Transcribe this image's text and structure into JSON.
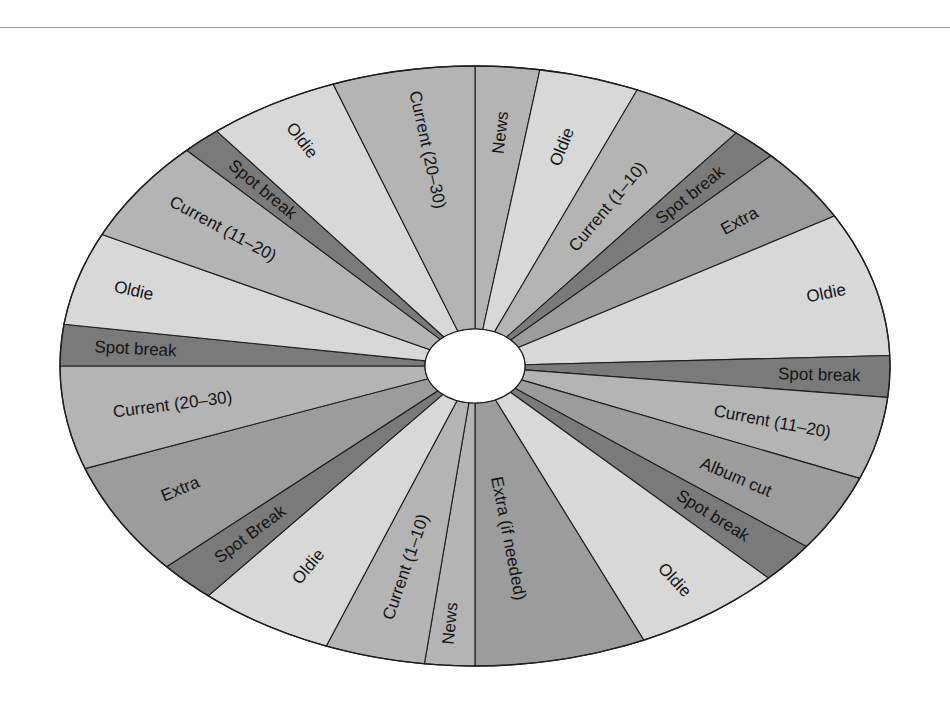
{
  "diagram": {
    "type": "radio-format-clock-wheel",
    "center": {
      "x": 475,
      "y": 366,
      "rx": 50,
      "ry": 37
    },
    "outer": {
      "rx": 415,
      "ry": 300
    },
    "colors": {
      "light": "#d8d8d8",
      "medium": "#b4b4b4",
      "medium_dark": "#9c9c9c",
      "dark": "#7a7a7a",
      "outline": "#1e1e1e"
    },
    "segments": [
      {
        "label": "News",
        "start": 270.0,
        "end": 279.0,
        "shade": "medium",
        "text_angle": 274.5,
        "text_r": 0.78
      },
      {
        "label": "Oldie",
        "start": 279.0,
        "end": 293.0,
        "shade": "light",
        "text_angle": 286.0,
        "text_r": 0.76
      },
      {
        "label": "Current (1–10)",
        "start": 293.0,
        "end": 309.0,
        "shade": "medium",
        "text_angle": 301.0,
        "text_r": 0.62
      },
      {
        "label": "Spot break",
        "start": 309.0,
        "end": 315.5,
        "shade": "dark",
        "text_angle": 312.3,
        "text_r": 0.77
      },
      {
        "label": "Extra",
        "start": 315.5,
        "end": 330.0,
        "shade": "medium_dark",
        "text_angle": 322.8,
        "text_r": 0.8
      },
      {
        "label": "Oldie",
        "start": 330.0,
        "end": 358.0,
        "shade": "light",
        "text_angle": 344.0,
        "text_r": 0.88
      },
      {
        "label": "Spot break",
        "start": 358.0,
        "end": 6.0,
        "shade": "dark",
        "text_angle": 2.0,
        "text_r": 0.83
      },
      {
        "label": "Current (11–20)",
        "start": 6.0,
        "end": 22.0,
        "shade": "medium",
        "text_angle": 14.5,
        "text_r": 0.74
      },
      {
        "label": "Album cut",
        "start": 22.0,
        "end": 37.0,
        "shade": "medium_dark",
        "text_angle": 30.5,
        "text_r": 0.73
      },
      {
        "label": "Spot break",
        "start": 37.0,
        "end": 45.0,
        "shade": "dark",
        "text_angle": 41.0,
        "text_r": 0.76
      },
      {
        "label": "Oldie",
        "start": 45.0,
        "end": 66.0,
        "shade": "light",
        "text_angle": 56.0,
        "text_r": 0.86
      },
      {
        "label": "Extra (if needed)",
        "start": 66.0,
        "end": 90.0,
        "shade": "medium_dark",
        "text_angle": 82.0,
        "text_r": 0.58
      },
      {
        "label": "News",
        "start": 90.0,
        "end": 97.0,
        "shade": "medium",
        "text_angle": 94.0,
        "text_r": 0.86
      },
      {
        "label": "Current (1–10)",
        "start": 97.0,
        "end": 111.0,
        "shade": "medium",
        "text_angle": 104.0,
        "text_r": 0.69
      },
      {
        "label": "Oldie",
        "start": 111.0,
        "end": 130.0,
        "shade": "light",
        "text_angle": 121.0,
        "text_r": 0.78
      },
      {
        "label": "Spot Break",
        "start": 130.0,
        "end": 138.0,
        "shade": "dark",
        "text_angle": 134.0,
        "text_r": 0.78
      },
      {
        "label": "Extra",
        "start": 138.0,
        "end": 160.0,
        "shade": "medium_dark",
        "text_angle": 150.0,
        "text_r": 0.82
      },
      {
        "label": "Current (20–30)",
        "start": 160.0,
        "end": 180.0,
        "shade": "medium",
        "text_angle": 170.0,
        "text_r": 0.74
      },
      {
        "label": "Spot break",
        "start": 180.0,
        "end": 188.0,
        "shade": "dark",
        "text_angle": 184.0,
        "text_r": 0.82
      },
      {
        "label": "Oldie",
        "start": 188.0,
        "end": 206.0,
        "shade": "light",
        "text_angle": 197.0,
        "text_r": 0.86
      },
      {
        "label": "Current (11–20)",
        "start": 206.0,
        "end": 226.0,
        "shade": "medium",
        "text_angle": 217.0,
        "text_r": 0.76
      },
      {
        "label": "Spot break",
        "start": 226.0,
        "end": 231.5,
        "shade": "dark",
        "text_angle": 229.0,
        "text_r": 0.78
      },
      {
        "label": "Oldie",
        "start": 231.5,
        "end": 250.0,
        "shade": "light",
        "text_angle": 241.0,
        "text_r": 0.86
      },
      {
        "label": "Current (20–30)",
        "start": 250.0,
        "end": 270.0,
        "shade": "medium",
        "text_angle": 261.0,
        "text_r": 0.73
      }
    ]
  }
}
